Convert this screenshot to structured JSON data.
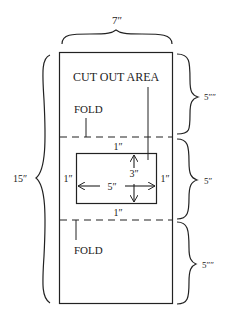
{
  "diagram": {
    "colors": {
      "line": "#222222",
      "background": "#ffffff"
    },
    "dimensions": {
      "width_label": "7″",
      "total_height_label": "15″",
      "top_section_label": "5″″",
      "middle_section_label": "5″",
      "bottom_section_label": "5″″"
    },
    "labels": {
      "cut_out_area": "CUT OUT AREA",
      "fold_top": "FOLD",
      "fold_bottom": "FOLD"
    },
    "cutout": {
      "margin_top": "1″",
      "margin_bottom": "1″",
      "margin_left": "1″",
      "margin_right": "1″",
      "width": "5″",
      "height": "3″"
    }
  }
}
